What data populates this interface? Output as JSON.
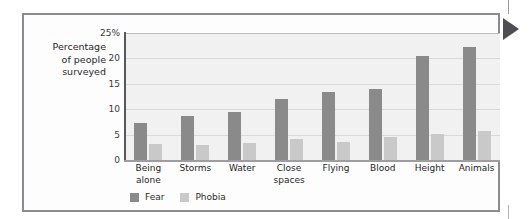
{
  "chart_data": {
    "type": "bar",
    "title": "",
    "subtitle": "",
    "xlabel": "",
    "ylabel": "Percentage\nof people\nsurveyed",
    "ylim": [
      0,
      25
    ],
    "yticks": [
      0,
      5,
      10,
      15,
      20,
      25
    ],
    "ytick_labels": [
      "0",
      "5",
      "10",
      "15",
      "20",
      "25%"
    ],
    "grid": true,
    "legend_position": "bottom-left",
    "categories": [
      "Being\nalone",
      "Storms",
      "Water",
      "Close\nspaces",
      "Flying",
      "Blood",
      "Height",
      "Animals"
    ],
    "series": [
      {
        "name": "Fear",
        "color": "#8a8a8a",
        "values": [
          7.3,
          8.7,
          9.4,
          12.0,
          13.3,
          14.0,
          20.4,
          22.3
        ]
      },
      {
        "name": "Phobia",
        "color": "#c9c9c9",
        "values": [
          3.1,
          2.9,
          3.3,
          4.2,
          3.6,
          4.5,
          5.2,
          5.7
        ]
      }
    ]
  },
  "legend": {
    "items": [
      {
        "label": "Fear",
        "swatch": "fear"
      },
      {
        "label": "Phobia",
        "swatch": "phobia"
      }
    ]
  },
  "colors": {
    "fear": "#8a8a8a",
    "phobia": "#c9c9c9",
    "plot_background": "#f1f1f1",
    "gridline": "#d9d9d9",
    "axis": "#57575a",
    "frame": "#8c8c90",
    "arrow_marker": "#4d4d52"
  }
}
